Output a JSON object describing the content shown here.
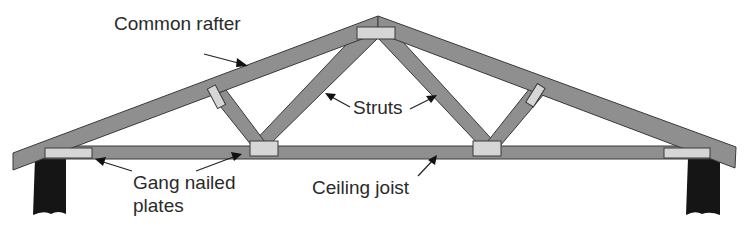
{
  "diagram": {
    "colors": {
      "timber": "#8f8f8f",
      "plate": "#d6d6d6",
      "post": "#151515",
      "outline": "#3a3a3a",
      "text": "#2a2a2a"
    },
    "labels": {
      "common_rafter": "Common rafter",
      "struts": "Struts",
      "gang_nailed_line1": "Gang nailed",
      "gang_nailed_line2": "plates",
      "ceiling_joist": "Ceiling joist"
    },
    "components": [
      {
        "name": "Common rafter",
        "count": 2
      },
      {
        "name": "Struts",
        "count": 4
      },
      {
        "name": "Ceiling joist",
        "count": 1
      },
      {
        "name": "Gang nailed plates",
        "count": 7
      },
      {
        "name": "Wall posts",
        "count": 2
      }
    ]
  }
}
